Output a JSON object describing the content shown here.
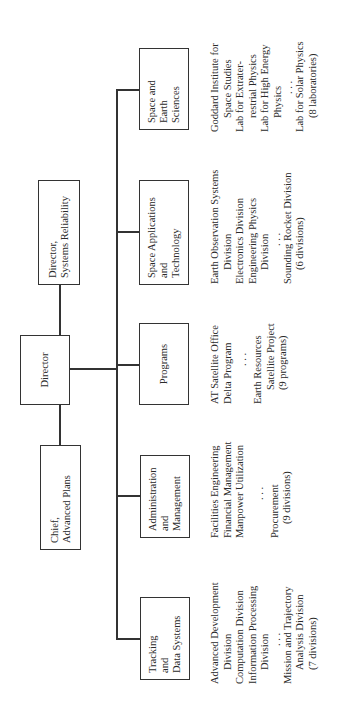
{
  "orientation": "rotated 90 degrees counter-clockwise",
  "top": {
    "director": "Director",
    "systems_reliability": [
      "Director,",
      "Systems Reliability"
    ],
    "advanced_plans": [
      "Chief,",
      "Advanced Plans"
    ]
  },
  "divisions": [
    {
      "title": [
        "Tracking",
        "and",
        "Data Systems"
      ],
      "items": [
        {
          "text": "Advanced Development",
          "indent": 0
        },
        {
          "text": "Division",
          "indent": 1
        },
        {
          "text": "Computation Division",
          "indent": 0
        },
        {
          "text": "Information Processing",
          "indent": 0
        },
        {
          "text": "Division",
          "indent": 1
        },
        {
          "text": ". . .",
          "indent": 2
        },
        {
          "text": "Mission and Trajectory",
          "indent": 0
        },
        {
          "text": "Analysis Division",
          "indent": 1
        },
        {
          "text": "(7 divisions)",
          "indent": 1
        }
      ]
    },
    {
      "title": [
        "Administration",
        "and",
        "Management"
      ],
      "items": [
        {
          "text": "Facilities Engineering",
          "indent": 0
        },
        {
          "text": "Financial Management",
          "indent": 0
        },
        {
          "text": "Manpower Utilization",
          "indent": 0
        },
        {
          "text": ". . .",
          "indent": 2
        },
        {
          "text": "Procurement",
          "indent": 0
        },
        {
          "text": "(9 divisions)",
          "indent": 1
        }
      ]
    },
    {
      "title": [
        "Programs"
      ],
      "items": [
        {
          "text": "AT Satellite Office",
          "indent": 0
        },
        {
          "text": "Delta Program",
          "indent": 0
        },
        {
          "text": ". . .",
          "indent": 2
        },
        {
          "text": "Earth Resources",
          "indent": 0
        },
        {
          "text": "Satellite Project",
          "indent": 1
        },
        {
          "text": "(9 programs)",
          "indent": 1
        }
      ]
    },
    {
      "title": [
        "Space Applications",
        "and",
        "Technology"
      ],
      "items": [
        {
          "text": "Earth Observation Systems",
          "indent": 0
        },
        {
          "text": "Division",
          "indent": 1
        },
        {
          "text": "Electronics Division",
          "indent": 0
        },
        {
          "text": "Engineering Physics",
          "indent": 0
        },
        {
          "text": "Division",
          "indent": 1
        },
        {
          "text": ". . .",
          "indent": 2
        },
        {
          "text": "Sounding Rocket Division",
          "indent": 0
        },
        {
          "text": "(6 divisions)",
          "indent": 1
        }
      ]
    },
    {
      "title": [
        "Space and",
        "Earth",
        "Sciences"
      ],
      "items": [
        {
          "text": "Goddard Institute for",
          "indent": 0
        },
        {
          "text": "Space Studies",
          "indent": 1
        },
        {
          "text": "Lab for Extrater-",
          "indent": 0
        },
        {
          "text": "restrial Physics",
          "indent": 1
        },
        {
          "text": "Lab for High Energy",
          "indent": 0
        },
        {
          "text": "Physics",
          "indent": 1
        },
        {
          "text": ". . .",
          "indent": 2
        },
        {
          "text": "Lab for Solar Physics",
          "indent": 0
        },
        {
          "text": "(8 laboratories)",
          "indent": 1
        }
      ]
    }
  ]
}
